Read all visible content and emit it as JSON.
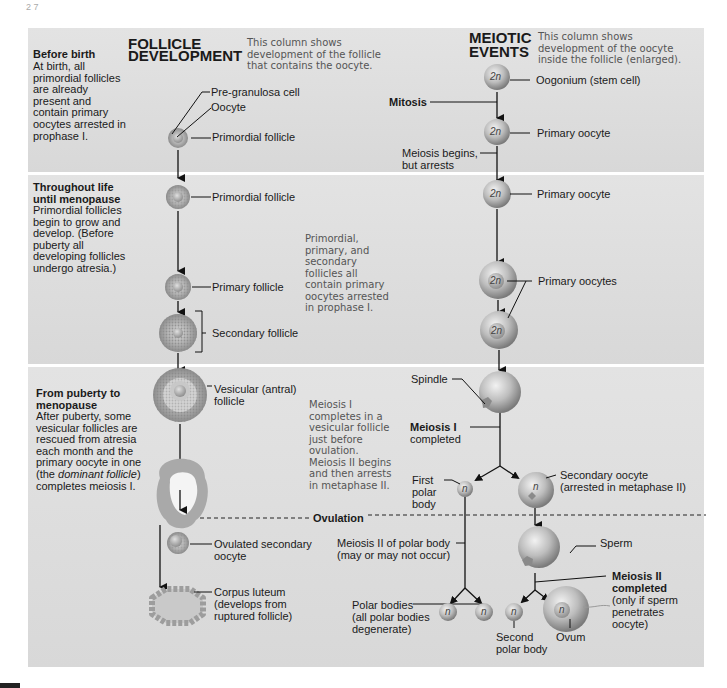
{
  "page_fragment": "2 7",
  "columns": {
    "follicle": {
      "title_line1": "FOLLICLE",
      "title_line2": "DEVELOPMENT",
      "note_lines": [
        "This column shows",
        "development of the follicle",
        "that contains the oocyte."
      ]
    },
    "meiotic": {
      "title_line1": "MEIOTIC",
      "title_line2": "EVENTS",
      "note_lines": [
        "This column shows",
        "development of the oocyte",
        "inside the follicle (enlarged)."
      ]
    }
  },
  "stages": [
    {
      "heading": "Before birth",
      "text_lines": [
        "At birth, all",
        "primordial follicles",
        "are already",
        "present and",
        "contain primary",
        "oocytes arrested in",
        "prophase I."
      ]
    },
    {
      "heading_lines": [
        "Throughout life",
        "until menopause"
      ],
      "text_lines": [
        "Primordial follicles",
        "begin to grow and",
        "develop. (Before",
        "puberty all",
        "developing follicles",
        "undergo atresia.)"
      ],
      "note_lines": [
        "Primordial,",
        "primary, and",
        "secondary",
        "follicles all",
        "contain primary",
        "oocytes arrested",
        "in prophase I."
      ]
    },
    {
      "heading_lines": [
        "From puberty to",
        "menopause"
      ],
      "text_lines": [
        "After puberty, some",
        "vesicular follicles are",
        "rescued from atresia",
        "each month and the",
        "primary oocyte in one"
      ],
      "text_italic_prefix": "(the ",
      "text_italic": "dominant follicle",
      "text_italic_suffix": ")",
      "text_last": "completes meiosis I.",
      "note_lines": [
        "Meiosis I",
        "completes in a",
        "vesicular follicle",
        "just before",
        "ovulation.",
        "Meiosis II begins",
        "and then arrests",
        "in metaphase II."
      ]
    }
  ],
  "follicle_labels": {
    "pre_granulosa": "Pre-granulosa cell",
    "oocyte": "Oocyte",
    "primordial_1": "Primordial follicle",
    "primordial_2": "Primordial follicle",
    "primary": "Primary follicle",
    "secondary": "Secondary follicle",
    "vesicular_1": "Vesicular (antral)",
    "vesicular_2": "follicle",
    "ovulated_1": "Ovulated secondary",
    "ovulated_2": "oocyte",
    "corpus_1": "Corpus luteum",
    "corpus_2": "(develops from",
    "corpus_3": "ruptured follicle)"
  },
  "meiotic_labels": {
    "oogonium": "Oogonium (stem cell)",
    "mitosis": "Mitosis",
    "primary_oocyte_1": "Primary oocyte",
    "meiosis_begins_1": "Meiosis begins,",
    "meiosis_begins_2": "but arrests",
    "primary_oocyte_2": "Primary oocyte",
    "primary_oocytes": "Primary oocytes",
    "spindle": "Spindle",
    "meiosis1_1": "Meiosis I",
    "meiosis1_2": "completed",
    "first_polar_1": "First",
    "first_polar_2": "polar",
    "first_polar_3": "body",
    "secondary_oocyte_1": "Secondary oocyte",
    "secondary_oocyte_2": "(arrested in metaphase II)",
    "ovulation": "Ovulation",
    "meiosis2_polar_1": "Meiosis II of polar body",
    "meiosis2_polar_2": "(may or may not occur)",
    "sperm": "Sperm",
    "meiosis2_1": "Meiosis II",
    "meiosis2_2": "completed",
    "meiosis2_3": "(only if sperm",
    "meiosis2_4": "penetrates",
    "meiosis2_5": "oocyte)",
    "polar_bodies_1": "Polar bodies",
    "polar_bodies_2": "(all polar bodies",
    "polar_bodies_3": "degenerate)",
    "second_polar_1": "Second",
    "second_polar_2": "polar body",
    "ovum": "Ovum"
  },
  "ploidy": {
    "diploid": "2n",
    "haploid": "n"
  },
  "colors": {
    "panel": "#dcdcdc",
    "cell": "#b9b9b9",
    "text": "#1a1a1a",
    "note": "#555555"
  }
}
